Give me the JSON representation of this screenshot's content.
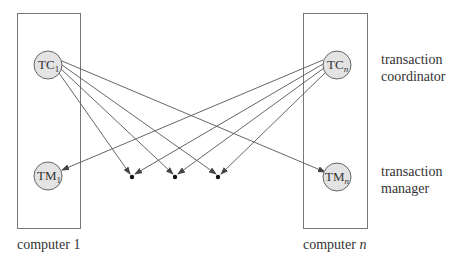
{
  "diagram": {
    "computers": [
      {
        "label": "computer 1",
        "label_main": "computer ",
        "label_var": "1"
      },
      {
        "label": "computer n",
        "label_main": "computer ",
        "label_var": "n"
      }
    ],
    "nodes": {
      "tc1": {
        "main": "TC",
        "sub": "1"
      },
      "tm1": {
        "main": "TM",
        "sub": "1"
      },
      "tcn": {
        "main": "TC",
        "sub": "n"
      },
      "tmn": {
        "main": "TM",
        "sub": "n"
      }
    },
    "legend": {
      "coordinator": [
        "transaction",
        "coordinator"
      ],
      "manager": [
        "transaction",
        "manager"
      ]
    },
    "colors": {
      "node_fill": "#e3e3e3",
      "stroke": "#555555",
      "box_stroke": "#666666",
      "text": "#333333"
    }
  }
}
